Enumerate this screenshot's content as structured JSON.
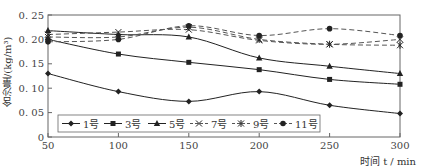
{
  "chart_data": {
    "type": "line",
    "title": "",
    "xlabel": "时间 t / min",
    "ylabel": "含沙量/(kg/m³)",
    "x": [
      50,
      100,
      150,
      200,
      250,
      300
    ],
    "xlim": [
      50,
      300
    ],
    "ylim": [
      0,
      0.25
    ],
    "xticks": [
      "50",
      "100",
      "150",
      "200",
      "250",
      "300"
    ],
    "yticks": [
      "0",
      "0.05",
      "0.10",
      "0.15",
      "0.20",
      "0.25"
    ],
    "grid": false,
    "legend_position": "bottom-inside",
    "series": [
      {
        "name": "1号",
        "marker": "diamond",
        "style": "solid",
        "values": [
          0.13,
          0.093,
          0.073,
          0.093,
          0.065,
          0.048
        ]
      },
      {
        "name": "3号",
        "marker": "square",
        "style": "solid",
        "values": [
          0.2,
          0.17,
          0.153,
          0.138,
          0.118,
          0.108
        ]
      },
      {
        "name": "5号",
        "marker": "triangle",
        "style": "solid",
        "values": [
          0.218,
          0.21,
          0.205,
          0.162,
          0.145,
          0.13
        ]
      },
      {
        "name": "7号",
        "marker": "x",
        "style": "dashed",
        "values": [
          0.21,
          0.215,
          0.22,
          0.198,
          0.19,
          0.2
        ]
      },
      {
        "name": "9号",
        "marker": "asterisk",
        "style": "dashed",
        "values": [
          0.205,
          0.205,
          0.225,
          0.2,
          0.19,
          0.188
        ]
      },
      {
        "name": "11号",
        "marker": "circle",
        "style": "dashed",
        "values": [
          0.195,
          0.2,
          0.228,
          0.208,
          0.222,
          0.208
        ]
      }
    ]
  },
  "labels": {
    "ylabel": "含沙量/(kg/m³)",
    "xlabel": "时间 t / min"
  },
  "colors": {
    "line": "#222222",
    "dashed": "#555555",
    "axis": "#666666"
  }
}
